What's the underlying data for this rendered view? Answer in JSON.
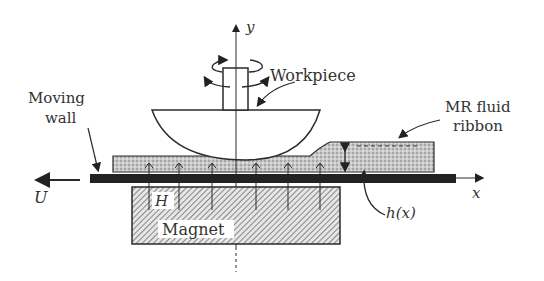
{
  "diagram": {
    "labels": {
      "y_axis": "y",
      "x_axis": "x",
      "workpiece": "Workpiece",
      "moving_wall_line1": "Moving",
      "moving_wall_line2": "wall",
      "mr_fluid_line1": "MR fluid",
      "mr_fluid_line2": "ribbon",
      "velocity": "U",
      "field": "H",
      "magnet": "Magnet",
      "gap_height": "h(x)"
    },
    "components": [
      {
        "name": "workpiece",
        "shape": "bowl-with-shaft",
        "motion": "rotation"
      },
      {
        "name": "moving-wall",
        "shape": "thick-bar",
        "motion": "translation in -x at U"
      },
      {
        "name": "mr-fluid-ribbon",
        "shape": "stippled-layer"
      },
      {
        "name": "magnet",
        "shape": "hatched-block"
      },
      {
        "name": "magnetic-field-arrows",
        "count": 7,
        "direction": "up"
      }
    ],
    "colors": {
      "line": "#2a2a2a",
      "wall": "#222222",
      "fluid": "#bdbdbd",
      "hatch": "#6a6a6a",
      "text": "#333333"
    }
  }
}
